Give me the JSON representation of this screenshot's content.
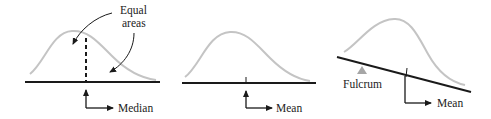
{
  "panels": [
    {
      "id": "median",
      "annotation_line1": "Equal",
      "annotation_line2": "areas",
      "pointer_label": "Median"
    },
    {
      "id": "mean",
      "pointer_label": "Mean"
    },
    {
      "id": "balance",
      "support_label": "Fulcrum",
      "pointer_label": "Mean"
    }
  ],
  "colors": {
    "curve": "#c4c4c4",
    "axis": "#1a1a1a",
    "fulcrum": "#a6a6a6",
    "text": "#222222"
  }
}
